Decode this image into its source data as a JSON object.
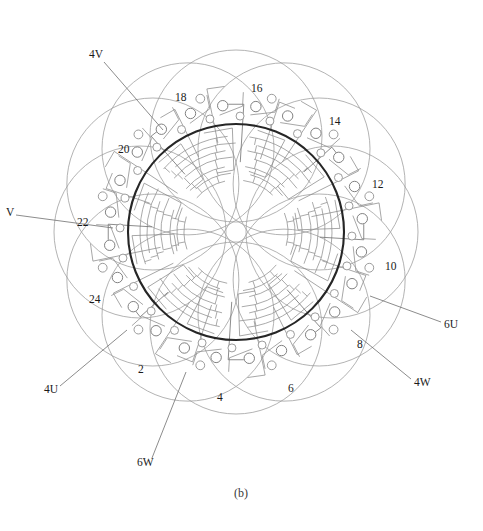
{
  "figure": {
    "caption": "(b)",
    "type": "stator-winding-layout-diagram",
    "geometry": {
      "center_x": 236,
      "center_y": 232,
      "bore_radius": 108,
      "petal_count": 12,
      "petal_radius": 86,
      "petal_center_radius": 96
    },
    "colors": {
      "bore_stroke": "#262626",
      "petal_stroke": "#9a9a9a",
      "inner_arc_stroke": "#8d8d8d",
      "connector_stroke": "#8a8a8a",
      "terminal_fill": "#ffffff",
      "terminal_stroke": "#8a8a8a",
      "label_text": "#1a1a1a",
      "leader_stroke": "#6e6e6e",
      "background": "#ffffff"
    }
  },
  "labels": {
    "slot_numbers": [
      {
        "id": "slot-2",
        "text": "2",
        "x": 138,
        "y": 370
      },
      {
        "id": "slot-4",
        "text": "4",
        "x": 217,
        "y": 398
      },
      {
        "id": "slot-6",
        "text": "6",
        "x": 288,
        "y": 389
      },
      {
        "id": "slot-8",
        "text": "8",
        "x": 357,
        "y": 345
      },
      {
        "id": "slot-10",
        "text": "10",
        "x": 385,
        "y": 267
      },
      {
        "id": "slot-12",
        "text": "12",
        "x": 372,
        "y": 185
      },
      {
        "id": "slot-14",
        "text": "14",
        "x": 329,
        "y": 122
      },
      {
        "id": "slot-16",
        "text": "16",
        "x": 251,
        "y": 89
      },
      {
        "id": "slot-18",
        "text": "18",
        "x": 175,
        "y": 98
      },
      {
        "id": "slot-20",
        "text": "20",
        "x": 118,
        "y": 150
      },
      {
        "id": "slot-22",
        "text": "22",
        "x": 77,
        "y": 223
      },
      {
        "id": "slot-24",
        "text": "24",
        "x": 89,
        "y": 300
      }
    ],
    "phase_terminals": [
      {
        "id": "terminal-4V",
        "text": "4V",
        "x": 89,
        "y": 55,
        "leader": [
          [
            104,
            62
          ],
          [
            163,
            130
          ]
        ]
      },
      {
        "id": "terminal-V",
        "text": "V",
        "x": 6,
        "y": 213,
        "leader": [
          [
            16,
            215
          ],
          [
            113,
            228
          ]
        ]
      },
      {
        "id": "terminal-4U",
        "text": "4U",
        "x": 44,
        "y": 390,
        "leader": [
          [
            60,
            386
          ],
          [
            127,
            330
          ]
        ]
      },
      {
        "id": "terminal-6W",
        "text": "6W",
        "x": 137,
        "y": 463,
        "leader": [
          [
            152,
            458
          ],
          [
            186,
            372
          ]
        ]
      },
      {
        "id": "terminal-4W",
        "text": "4W",
        "x": 414,
        "y": 383,
        "leader": [
          [
            411,
            379
          ],
          [
            351,
            330
          ]
        ]
      },
      {
        "id": "terminal-6U",
        "text": "6U",
        "x": 444,
        "y": 325,
        "leader": [
          [
            441,
            322
          ],
          [
            370,
            296
          ]
        ]
      }
    ]
  }
}
